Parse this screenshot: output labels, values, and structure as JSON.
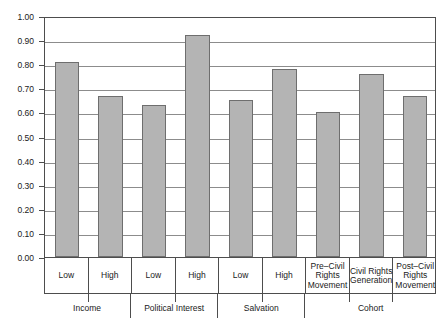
{
  "chart_data": {
    "type": "bar",
    "title": "",
    "subtitle": "",
    "xlabel": "",
    "ylabel": "",
    "ylim": [
      0.0,
      1.0
    ],
    "ytick_labels": [
      "1.00",
      "0.90",
      "0.80",
      "0.70",
      "0.60",
      "0.50",
      "0.40",
      "0.30",
      "0.20",
      "0.10",
      "0.00"
    ],
    "ytick_values": [
      1.0,
      0.9,
      0.8,
      0.7,
      0.6,
      0.5,
      0.4,
      0.3,
      0.2,
      0.1,
      0.0
    ],
    "grid": true,
    "legend": "none",
    "bar_color": "#b4b4b4",
    "bar_edge_color": "#6e6e6e",
    "axis_color": "#4d4d4d",
    "categories": [
      "Low",
      "High",
      "Low",
      "High",
      "Low",
      "High",
      "Pre–Civil Rights Movement",
      "Civil Rights Generation",
      "Post–Civil Rights Movement"
    ],
    "category_lines": [
      [
        "Low"
      ],
      [
        "High"
      ],
      [
        "Low"
      ],
      [
        "High"
      ],
      [
        "Low"
      ],
      [
        "High"
      ],
      [
        "Pre–Civil",
        "Rights",
        "Movement"
      ],
      [
        "Civil Rights",
        "Generation"
      ],
      [
        "Post–Civil",
        "Rights",
        "Movement"
      ]
    ],
    "values": [
      0.81,
      0.67,
      0.63,
      0.92,
      0.65,
      0.78,
      0.6,
      0.76,
      0.67
    ],
    "groups": [
      {
        "label": "Income",
        "span": 2
      },
      {
        "label": "Political Interest",
        "span": 2
      },
      {
        "label": "Salvation",
        "span": 2
      },
      {
        "label": "Cohort",
        "span": 3
      }
    ]
  }
}
